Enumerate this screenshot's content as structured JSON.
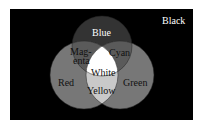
{
  "diagram": {
    "background": {
      "label": "Black",
      "color": "#000000"
    },
    "circles": [
      {
        "name": "Blue",
        "cx": 102,
        "cy": 46,
        "r": 30,
        "fill": "#3a3a3a"
      },
      {
        "name": "Red",
        "cx": 84,
        "cy": 75,
        "r": 34,
        "fill": "#6e6e6e"
      },
      {
        "name": "Green",
        "cx": 120,
        "cy": 75,
        "r": 34,
        "fill": "#6e6e6e"
      }
    ],
    "labels": {
      "black": "Black",
      "blue": "Blue",
      "magenta_1": "Mag-",
      "magenta_2": "enta",
      "cyan": "Cyan",
      "white": "White",
      "red": "Red",
      "green": "Green",
      "yellow": "Yellow"
    },
    "colors": {
      "blue_region": "#333333",
      "pair_overlap": "#595959",
      "red_green_region": "#777777",
      "white_region": "#ffffff",
      "label_light": "#ffffff",
      "label_dark": "#111111"
    }
  }
}
